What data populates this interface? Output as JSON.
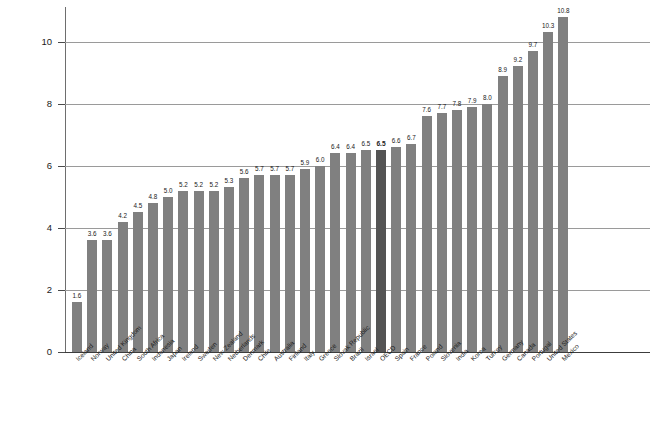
{
  "chart_data": {
    "type": "bar",
    "title": "",
    "subtitle": "",
    "xlabel": "",
    "ylabel": "",
    "ylim": [
      0,
      11.2
    ],
    "yticks": [
      0,
      2,
      4,
      6,
      8,
      10
    ],
    "grid": true,
    "legend": "none",
    "highlight_category": "OECD",
    "colors": {
      "bar": "#808080",
      "highlight_bar": "#545454",
      "gridline": "#9a9a9a",
      "axis": "#3c3c3c",
      "text": "#1a1a1a",
      "background": "#ffffff"
    },
    "categories": [
      "Iceland",
      "Norway",
      "United Kingdom",
      "China",
      "South Africa",
      "Indonesia",
      "Japan",
      "Ireland",
      "Sweden",
      "New Zealand",
      "Netherlands",
      "Denmark",
      "Chile",
      "Australia",
      "Finland",
      "Italy",
      "Greece",
      "Slovak Republic",
      "Brazil",
      "Israel",
      "OECD",
      "Spain",
      "France",
      "Poland",
      "Slovenia",
      "India",
      "Korea",
      "Turkey",
      "Germany",
      "Canada",
      "Portugal",
      "United States",
      "Mexico"
    ],
    "values": [
      1.6,
      3.6,
      3.6,
      4.2,
      4.5,
      4.8,
      5.0,
      5.2,
      5.2,
      5.2,
      5.3,
      5.6,
      5.7,
      5.7,
      5.7,
      5.9,
      6.0,
      6.4,
      6.4,
      6.5,
      6.5,
      6.6,
      6.7,
      7.6,
      7.7,
      7.8,
      7.9,
      8.0,
      8.9,
      9.2,
      9.7,
      10.3,
      10.8
    ],
    "value_labels": [
      "1.6",
      "3.6",
      "3.6",
      "4.2",
      "4.5",
      "4.8",
      "5.0",
      "5.2",
      "5.2",
      "5.2",
      "5.3",
      "5.6",
      "5.7",
      "5.7",
      "5.7",
      "5.9",
      "6.0",
      "6.4",
      "6.4",
      "6.5",
      "6.5",
      "6.6",
      "6.7",
      "7.6",
      "7.7",
      "7.8",
      "7.9",
      "8.0",
      "8.9",
      "9.2",
      "9.7",
      "10.3",
      "10.8"
    ],
    "ytick_labels": [
      "0",
      "2",
      "4",
      "6",
      "8",
      "10"
    ]
  }
}
